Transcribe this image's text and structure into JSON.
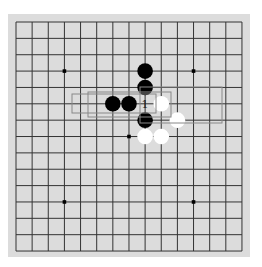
{
  "board": {
    "size": 15,
    "origin": [
      16,
      22
    ],
    "spacing": [
      16.14,
      16.36
    ],
    "background": "#dcdcdc",
    "line_color": "#333333",
    "star_points": [
      [
        3,
        3
      ],
      [
        11,
        3
      ],
      [
        7,
        7
      ],
      [
        3,
        11
      ],
      [
        11,
        11
      ]
    ],
    "stones": [
      {
        "color": "black",
        "col": 8,
        "row": 3
      },
      {
        "color": "black",
        "col": 8,
        "row": 4
      },
      {
        "color": "black",
        "col": 6,
        "row": 5
      },
      {
        "color": "black",
        "col": 7,
        "row": 5
      },
      {
        "color": "white",
        "col": 9,
        "row": 5
      },
      {
        "color": "black",
        "col": 8,
        "row": 6
      },
      {
        "color": "white",
        "col": 10,
        "row": 6
      },
      {
        "color": "white",
        "col": 8,
        "row": 7
      },
      {
        "color": "white",
        "col": 9,
        "row": 7
      }
    ],
    "markers": [
      {
        "label": "1",
        "col": 8,
        "row": 5
      }
    ],
    "highlight_boxes": [
      {
        "x1": 72,
        "y1": 94,
        "x2": 156,
        "y2": 113
      },
      {
        "x1": 88,
        "y1": 92,
        "x2": 171,
        "y2": 117
      },
      {
        "x1": 140,
        "y1": 87,
        "x2": 222,
        "y2": 123
      }
    ],
    "box_color": "#888888"
  }
}
